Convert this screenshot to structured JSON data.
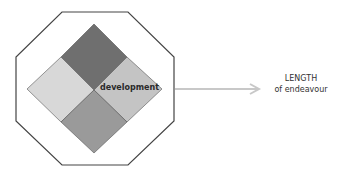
{
  "diagram": {
    "octagon": {
      "stroke": "#444444",
      "fill": "#ffffff"
    },
    "diamond": {
      "quadrants": [
        {
          "position": "top",
          "color": "#6f6f6f"
        },
        {
          "position": "left",
          "color": "#d8d8d8"
        },
        {
          "position": "right",
          "color": "#c4c4c4"
        },
        {
          "position": "bottom",
          "color": "#9a9a9a"
        }
      ],
      "label": "development"
    },
    "arrow": {
      "color": "#c8c8c8"
    },
    "target": {
      "line1": "LENGTH",
      "line2": "of endeavour"
    }
  }
}
